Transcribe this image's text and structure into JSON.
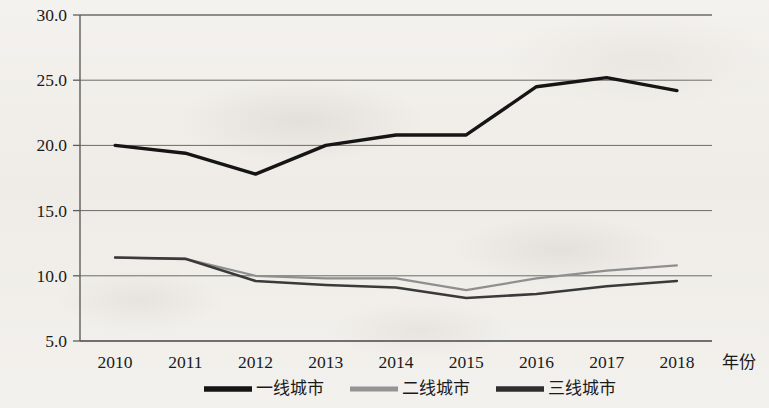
{
  "chart_data": {
    "type": "line",
    "title": "",
    "xlabel": "年份",
    "ylabel": "",
    "categories": [
      "2010",
      "2011",
      "2012",
      "2013",
      "2014",
      "2015",
      "2016",
      "2017",
      "2018"
    ],
    "ylim": [
      5.0,
      30.0
    ],
    "ytick_labels": [
      "30.0",
      "25.0",
      "20.0",
      "15.0",
      "10.0",
      "5.0"
    ],
    "ytick_values": [
      30.0,
      25.0,
      20.0,
      15.0,
      10.0,
      5.0
    ],
    "grid": true,
    "legend_position": "bottom",
    "series": [
      {
        "name": "一线城市",
        "color": "#151515",
        "width": 3.4,
        "values": [
          20.0,
          19.4,
          17.8,
          20.0,
          20.8,
          20.8,
          24.5,
          25.2,
          24.2
        ]
      },
      {
        "name": "二线城市",
        "color": "#8f8f8f",
        "width": 2.2,
        "values": [
          11.4,
          11.3,
          10.0,
          9.8,
          9.8,
          8.9,
          9.8,
          10.4,
          10.8
        ]
      },
      {
        "name": "三线城市",
        "color": "#3a3a3a",
        "width": 2.6,
        "values": [
          11.4,
          11.3,
          9.6,
          9.3,
          9.1,
          8.3,
          8.6,
          9.2,
          9.6
        ]
      }
    ]
  },
  "legend": {
    "items": [
      {
        "label": "一线城市",
        "color": "#151515",
        "marker": "line-swatch-thick"
      },
      {
        "label": "二线城市",
        "color": "#949494",
        "marker": "line-swatch-gray"
      },
      {
        "label": "三线城市",
        "color": "#2e2e2e",
        "marker": "line-swatch-dark"
      }
    ]
  },
  "axes": {
    "x_axis_title": "年份"
  }
}
